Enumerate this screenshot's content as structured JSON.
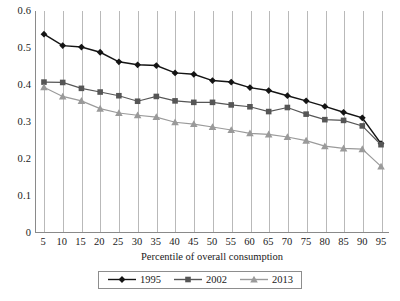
{
  "chart_data": {
    "type": "line",
    "title": "",
    "xlabel": "Percentile of overall consumption",
    "ylabel": "",
    "xlim": [
      5,
      95
    ],
    "ylim": [
      0,
      0.6
    ],
    "grid": "vertical",
    "legend_position": "bottom",
    "x": [
      5,
      10,
      15,
      20,
      25,
      30,
      35,
      40,
      45,
      50,
      55,
      60,
      65,
      70,
      75,
      80,
      85,
      90,
      95
    ],
    "categories": [
      "5",
      "10",
      "15",
      "20",
      "25",
      "30",
      "35",
      "40",
      "45",
      "50",
      "55",
      "60",
      "65",
      "70",
      "75",
      "80",
      "85",
      "90",
      "95"
    ],
    "ytick_labels": [
      "0",
      "0.1",
      "0.2",
      "0.3",
      "0.4",
      "0.5",
      "0.6"
    ],
    "ytick_values": [
      0,
      0.1,
      0.2,
      0.3,
      0.4,
      0.5,
      0.6
    ],
    "series": [
      {
        "name": "1995",
        "color": "#141414",
        "marker": "diamond",
        "values": [
          0.537,
          0.506,
          0.502,
          0.488,
          0.462,
          0.454,
          0.452,
          0.432,
          0.428,
          0.411,
          0.407,
          0.392,
          0.384,
          0.37,
          0.356,
          0.341,
          0.325,
          0.31,
          0.24
        ]
      },
      {
        "name": "2002",
        "color": "#565656",
        "marker": "square",
        "values": [
          0.407,
          0.406,
          0.39,
          0.38,
          0.37,
          0.355,
          0.368,
          0.356,
          0.352,
          0.352,
          0.345,
          0.34,
          0.327,
          0.338,
          0.32,
          0.305,
          0.303,
          0.288,
          0.237
        ]
      },
      {
        "name": "2013",
        "color": "#9a9a9a",
        "marker": "triangle",
        "values": [
          0.393,
          0.368,
          0.356,
          0.335,
          0.323,
          0.317,
          0.312,
          0.298,
          0.293,
          0.285,
          0.277,
          0.268,
          0.265,
          0.258,
          0.248,
          0.233,
          0.227,
          0.225,
          0.178
        ]
      }
    ]
  },
  "legend": {
    "items": [
      {
        "label": "1995"
      },
      {
        "label": "2002"
      },
      {
        "label": "2013"
      }
    ]
  },
  "axes": {
    "x_title": "Percentile of overall consumption"
  },
  "colors": {
    "series_1995": "#141414",
    "series_2002": "#565656",
    "series_2013": "#9a9a9a",
    "gridline": "#b9b9b9",
    "axis": "#8a8a8a",
    "background": "#ffffff",
    "text": "#1a1a1a"
  }
}
